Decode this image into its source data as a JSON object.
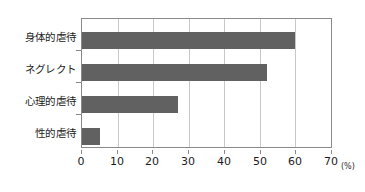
{
  "chart_data": {
    "type": "bar",
    "orientation": "horizontal",
    "title": "",
    "xlabel": "(%)",
    "ylabel": "",
    "categories": [
      "身体的虐待",
      "ネグレクト",
      "心理的虐待",
      "性的虐待"
    ],
    "values": [
      60,
      52,
      27,
      5
    ],
    "series": [
      {
        "name": "",
        "values": [
          60,
          52,
          27,
          5
        ]
      }
    ],
    "xlim": [
      0,
      70
    ],
    "xticks": [
      0,
      10,
      20,
      30,
      40,
      50,
      60,
      70
    ],
    "xtick_labels": [
      "0",
      "10",
      "20",
      "30",
      "40",
      "50",
      "60",
      "70"
    ],
    "grid": true,
    "grid_axis": "x",
    "legend": false,
    "legend_position": "none",
    "bar_color": "#616161",
    "axis_color": "#8a8a8a",
    "grid_color": "#c9c9c9",
    "background_color": "#ffffff",
    "unit_note": "(%)"
  }
}
